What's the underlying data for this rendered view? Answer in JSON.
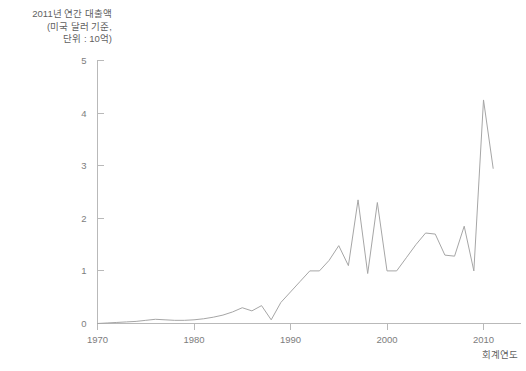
{
  "chart_data": {
    "type": "line",
    "title": "",
    "ylabel": "2011년 연간 대출액\n(미국 달러 기준,\n단위 : 10억)",
    "xlabel": "회계연도",
    "xlim": [
      1970,
      2011
    ],
    "ylim": [
      0,
      5
    ],
    "xticks": [
      1970,
      1980,
      1990,
      2000,
      2010
    ],
    "xtick_labels": [
      "1970",
      "1980",
      "1990",
      "2000",
      "2010"
    ],
    "yticks": [
      0,
      1,
      2,
      3,
      4,
      5
    ],
    "ytick_labels": [
      "0",
      "1",
      "2",
      "3",
      "4",
      "5"
    ],
    "grid": false,
    "legend": "none",
    "line_color": "#a6a6a6",
    "series": [
      {
        "name": "연간 대출액",
        "x": [
          1970,
          1971,
          1972,
          1973,
          1974,
          1975,
          1976,
          1977,
          1978,
          1979,
          1980,
          1981,
          1982,
          1983,
          1984,
          1985,
          1986,
          1987,
          1988,
          1989,
          1990,
          1991,
          1992,
          1993,
          1994,
          1995,
          1996,
          1997,
          1998,
          1999,
          2000,
          2001,
          2002,
          2003,
          2004,
          2005,
          2006,
          2007,
          2008,
          2009,
          2010,
          2011
        ],
        "values": [
          0.0,
          0.01,
          0.02,
          0.03,
          0.04,
          0.06,
          0.08,
          0.07,
          0.06,
          0.06,
          0.07,
          0.09,
          0.12,
          0.16,
          0.22,
          0.3,
          0.24,
          0.34,
          0.07,
          0.4,
          0.6,
          0.8,
          1.0,
          1.0,
          1.2,
          1.48,
          1.1,
          2.35,
          0.95,
          2.3,
          1.0,
          1.0,
          1.25,
          1.5,
          1.72,
          1.7,
          1.3,
          1.28,
          1.85,
          1.0,
          4.25,
          2.95
        ]
      }
    ]
  },
  "axis_titles": {
    "y": "2011년 연간 대출액\n(미국 달러 기준,\n단위 : 10억)",
    "x": "회계연도"
  }
}
